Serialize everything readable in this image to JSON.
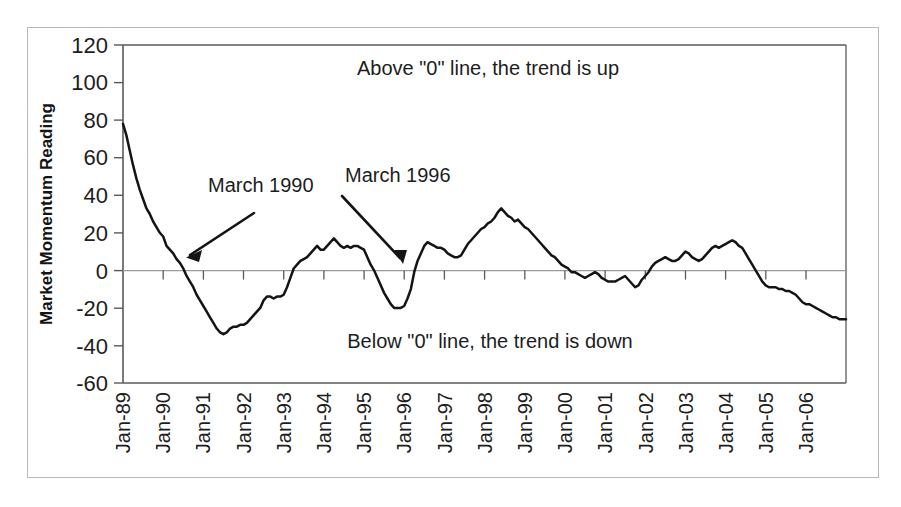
{
  "chart_data": {
    "type": "line",
    "title": "",
    "xlabel": "",
    "ylabel": "Market Momentum Reading",
    "ylim": [
      -60,
      120
    ],
    "yticks": [
      120,
      100,
      80,
      60,
      40,
      20,
      0,
      -20,
      -40,
      -60
    ],
    "grid": false,
    "zero_line": 0,
    "legend": "none",
    "xlim": [
      "Jan-89",
      "Jan-07"
    ],
    "xticks": [
      "Jan-89",
      "Jan-90",
      "Jan-91",
      "Jan-92",
      "Jan-93",
      "Jan-94",
      "Jan-95",
      "Jan-96",
      "Jan-97",
      "Jan-98",
      "Jan-99",
      "Jan-00",
      "Jan-01",
      "Jan-02",
      "Jan-03",
      "Jan-04",
      "Jan-05",
      "Jan-06"
    ],
    "series": [
      {
        "name": "Market Momentum Reading",
        "color": "#141414",
        "x": [
          "1989.00",
          "1989.08",
          "1989.17",
          "1989.25",
          "1989.33",
          "1989.42",
          "1989.50",
          "1989.58",
          "1989.67",
          "1989.75",
          "1989.83",
          "1989.92",
          "1990.00",
          "1990.08",
          "1990.17",
          "1990.25",
          "1990.33",
          "1990.42",
          "1990.50",
          "1990.58",
          "1990.67",
          "1990.75",
          "1990.83",
          "1990.92",
          "1991.00",
          "1991.08",
          "1991.17",
          "1991.25",
          "1991.33",
          "1991.42",
          "1991.50",
          "1991.58",
          "1991.67",
          "1991.75",
          "1991.83",
          "1991.92",
          "1992.00",
          "1992.08",
          "1992.17",
          "1992.25",
          "1992.33",
          "1992.42",
          "1992.50",
          "1992.58",
          "1992.67",
          "1992.75",
          "1992.83",
          "1992.92",
          "1993.00",
          "1993.08",
          "1993.17",
          "1993.25",
          "1993.33",
          "1993.42",
          "1993.50",
          "1993.58",
          "1993.67",
          "1993.75",
          "1993.83",
          "1993.92",
          "1994.00",
          "1994.08",
          "1994.17",
          "1994.25",
          "1994.33",
          "1994.42",
          "1994.50",
          "1994.58",
          "1994.67",
          "1994.75",
          "1994.83",
          "1994.92",
          "1995.00",
          "1995.08",
          "1995.17",
          "1995.25",
          "1995.33",
          "1995.42",
          "1995.50",
          "1995.58",
          "1995.67",
          "1995.75",
          "1995.83",
          "1995.92",
          "1996.00",
          "1996.08",
          "1996.17",
          "1996.25",
          "1996.33",
          "1996.42",
          "1996.50",
          "1996.58",
          "1996.67",
          "1996.75",
          "1996.83",
          "1996.92",
          "1997.00",
          "1997.08",
          "1997.17",
          "1997.25",
          "1997.33",
          "1997.42",
          "1997.50",
          "1997.58",
          "1997.67",
          "1997.75",
          "1997.83",
          "1997.92",
          "1998.00",
          "1998.08",
          "1998.17",
          "1998.25",
          "1998.33",
          "1998.42",
          "1998.50",
          "1998.58",
          "1998.67",
          "1998.75",
          "1998.83",
          "1998.92",
          "1999.00",
          "1999.08",
          "1999.17",
          "1999.25",
          "1999.33",
          "1999.42",
          "1999.50",
          "1999.58",
          "1999.67",
          "1999.75",
          "1999.83",
          "1999.92",
          "2000.00",
          "2000.08",
          "2000.17",
          "2000.25",
          "2000.33",
          "2000.42",
          "2000.50",
          "2000.58",
          "2000.67",
          "2000.75",
          "2000.83",
          "2000.92",
          "2001.00",
          "2001.08",
          "2001.17",
          "2001.25",
          "2001.33",
          "2001.42",
          "2001.50",
          "2001.58",
          "2001.67",
          "2001.75",
          "2001.83",
          "2001.92",
          "2002.00",
          "2002.08",
          "2002.17",
          "2002.25",
          "2002.33",
          "2002.42",
          "2002.50",
          "2002.58",
          "2002.67",
          "2002.75",
          "2002.83",
          "2002.92",
          "2003.00",
          "2003.08",
          "2003.17",
          "2003.25",
          "2003.33",
          "2003.42",
          "2003.50",
          "2003.58",
          "2003.67",
          "2003.75",
          "2003.83",
          "2003.92",
          "2004.00",
          "2004.08",
          "2004.17",
          "2004.25",
          "2004.33",
          "2004.42",
          "2004.50",
          "2004.58",
          "2004.67",
          "2004.75",
          "2004.83",
          "2004.92",
          "2005.00",
          "2005.08",
          "2005.17",
          "2005.25",
          "2005.33",
          "2005.42",
          "2005.50",
          "2005.58",
          "2005.67",
          "2005.75",
          "2005.83",
          "2005.92",
          "2006.00",
          "2006.08",
          "2006.17",
          "2006.25",
          "2006.33",
          "2006.42",
          "2006.50",
          "2006.58",
          "2006.67",
          "2006.75",
          "2006.83",
          "2006.92",
          "2007.00"
        ],
        "values": [
          78,
          72,
          64,
          56,
          49,
          43,
          38,
          33,
          30,
          26,
          23,
          20,
          18,
          13,
          11,
          9,
          6,
          4,
          1,
          -3,
          -6,
          -9,
          -13,
          -16,
          -19,
          -22,
          -25,
          -28,
          -31,
          -33,
          -34,
          -33,
          -31,
          -30,
          -30,
          -29,
          -29,
          -28,
          -26,
          -24,
          -22,
          -20,
          -16,
          -14,
          -14,
          -15,
          -14,
          -14,
          -13,
          -9,
          -4,
          1,
          3,
          5,
          6,
          7,
          9,
          11,
          13,
          11,
          11,
          13,
          15,
          17,
          15,
          13,
          12,
          13,
          12,
          13,
          13,
          12,
          11,
          7,
          3,
          0,
          -4,
          -8,
          -12,
          -15,
          -18,
          -20,
          -20,
          -20,
          -19,
          -15,
          -10,
          -1,
          5,
          9,
          13,
          15,
          14,
          13,
          12,
          12,
          11,
          9,
          8,
          7,
          7,
          8,
          11,
          14,
          16,
          18,
          20,
          22,
          23,
          25,
          26,
          28,
          31,
          33,
          31,
          29,
          28,
          26,
          27,
          25,
          23,
          22,
          20,
          18,
          16,
          14,
          12,
          10,
          8,
          7,
          5,
          3,
          2,
          1,
          -1,
          -1,
          -2,
          -3,
          -4,
          -3,
          -2,
          -1,
          -2,
          -4,
          -5,
          -6,
          -6,
          -6,
          -5,
          -4,
          -3,
          -5,
          -7,
          -9,
          -8,
          -5,
          -3,
          -1,
          2,
          4,
          5,
          6,
          7,
          6,
          5,
          5,
          6,
          8,
          10,
          9,
          7,
          6,
          5,
          6,
          8,
          10,
          12,
          13,
          12,
          13,
          14,
          15,
          16,
          15,
          13,
          12,
          9,
          6,
          3,
          0,
          -3,
          -6,
          -8,
          -9,
          -9,
          -9,
          -10,
          -10,
          -11,
          -11,
          -12,
          -13,
          -15,
          -17,
          -18,
          -18,
          -19,
          -20,
          -21,
          -22,
          -23,
          -24,
          -25,
          -25,
          -26,
          -26,
          -26
        ]
      }
    ],
    "annotations": [
      {
        "name": "march-1990",
        "text": "March 1990",
        "points_to": "zero crossing March 1990"
      },
      {
        "name": "march-1996",
        "text": "March 1996",
        "points_to": "zero crossing March 1996"
      },
      {
        "name": "above-zero-note",
        "text": "Above \"0\" line, the trend is up"
      },
      {
        "name": "below-zero-note",
        "text": "Below \"0\" line, the trend is down"
      }
    ]
  },
  "axis": {
    "y_title": "Market Momentum Reading",
    "y_ticks": [
      "120",
      "100",
      "80",
      "60",
      "40",
      "20",
      "0",
      "-20",
      "-40",
      "-60"
    ],
    "x_ticks": [
      "Jan-89",
      "Jan-90",
      "Jan-91",
      "Jan-92",
      "Jan-93",
      "Jan-94",
      "Jan-95",
      "Jan-96",
      "Jan-97",
      "Jan-98",
      "Jan-99",
      "Jan-00",
      "Jan-01",
      "Jan-02",
      "Jan-03",
      "Jan-04",
      "Jan-05",
      "Jan-06"
    ]
  },
  "annotations": {
    "above_note": "Above \"0\" line, the trend is up",
    "below_note": "Below \"0\" line, the trend is down",
    "label_1990": "March 1990",
    "label_1996": "March 1996"
  },
  "colors": {
    "line": "#141414",
    "axis": "#5a5a5a",
    "zero_line": "#9a9a9a",
    "frame": "#b9b9b9",
    "text": "#1d1d1d",
    "background": "#ffffff"
  }
}
